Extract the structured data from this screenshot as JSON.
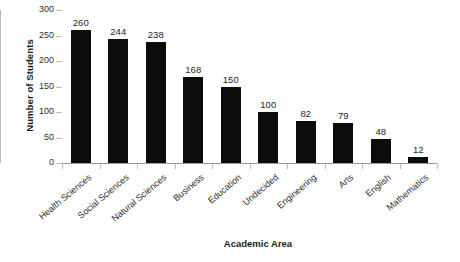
{
  "chart_data": {
    "type": "bar",
    "title": "",
    "xlabel": "Academic Area",
    "ylabel": "Number of Students",
    "categories": [
      "Health Sciences",
      "Social Sciences",
      "Natural Sciences",
      "Business",
      "Education",
      "Undecided",
      "Engineering",
      "Arts",
      "English",
      "Mathematics"
    ],
    "values": [
      260,
      244,
      238,
      168,
      150,
      100,
      82,
      79,
      48,
      12
    ],
    "value_labels": [
      "260",
      "244",
      "238",
      "168",
      "150",
      "100",
      "82",
      "79",
      "48",
      "12"
    ],
    "ylim": [
      0,
      300
    ],
    "ytick_labels": [
      "300",
      "250",
      "200",
      "150",
      "100",
      "50",
      "0"
    ],
    "ytick_values": [
      300,
      250,
      200,
      150,
      100,
      50,
      0
    ],
    "grid": false,
    "legend": false,
    "bar_color": "#0c0c0c",
    "background_color": "#ffffff",
    "axis_color": "#9a9a9a"
  }
}
